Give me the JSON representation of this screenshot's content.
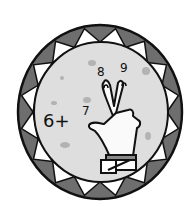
{
  "illustration": {
    "subject": "counting-on with fingers",
    "expression_start": "6+",
    "counted_numbers": [
      "7",
      "8",
      "9"
    ],
    "colors": {
      "background": "#ffffff",
      "ring_dark": "#6e6e6e",
      "ring_light": "#ffffff",
      "disc": "#dedede",
      "speckle": "#a9a9a9",
      "outline": "#111111",
      "cuff": "#8a8a8a"
    }
  }
}
